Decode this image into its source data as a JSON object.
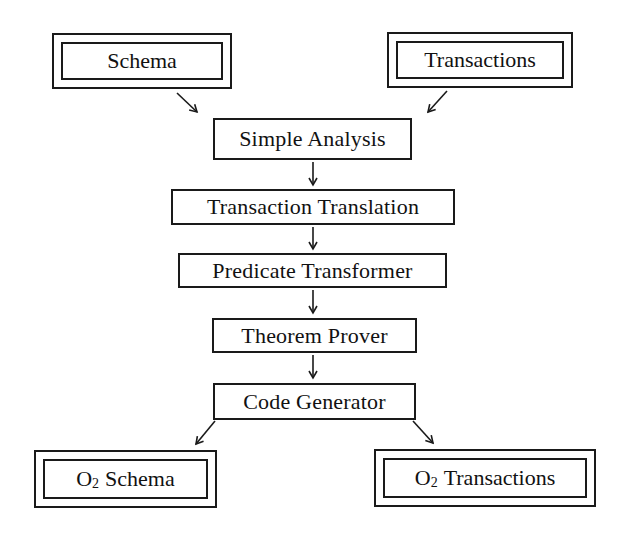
{
  "diagram": {
    "type": "flowchart",
    "inputs": [
      {
        "id": "schema",
        "label": "Schema"
      },
      {
        "id": "transactions",
        "label": "Transactions"
      }
    ],
    "steps": [
      {
        "id": "simple-analysis",
        "label": "Simple Analysis"
      },
      {
        "id": "transaction-translation",
        "label": "Transaction Translation"
      },
      {
        "id": "predicate-transformer",
        "label": "Predicate Transformer"
      },
      {
        "id": "theorem-prover",
        "label": "Theorem Prover"
      },
      {
        "id": "code-generator",
        "label": "Code Generator"
      }
    ],
    "outputs": [
      {
        "id": "o2-schema",
        "prefix": "O",
        "subscript": "2",
        "label": "Schema"
      },
      {
        "id": "o2-transactions",
        "prefix": "O",
        "subscript": "2",
        "label": "Transactions"
      }
    ],
    "edges": [
      {
        "from": "schema",
        "to": "simple-analysis"
      },
      {
        "from": "transactions",
        "to": "simple-analysis"
      },
      {
        "from": "simple-analysis",
        "to": "transaction-translation"
      },
      {
        "from": "transaction-translation",
        "to": "predicate-transformer"
      },
      {
        "from": "predicate-transformer",
        "to": "theorem-prover"
      },
      {
        "from": "theorem-prover",
        "to": "code-generator"
      },
      {
        "from": "code-generator",
        "to": "o2-schema"
      },
      {
        "from": "code-generator",
        "to": "o2-transactions"
      }
    ],
    "colors": {
      "stroke": "#1a1a1a",
      "background": "#ffffff",
      "text": "#111111"
    }
  }
}
